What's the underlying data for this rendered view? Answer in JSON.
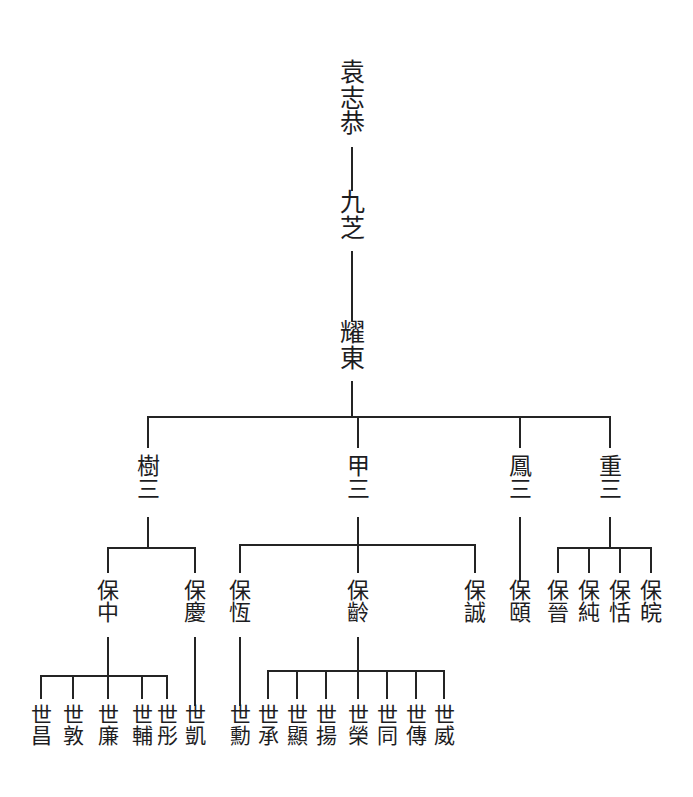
{
  "document": {
    "kind": "genealogy-chart",
    "orientation": "vertical-top-down",
    "script": "traditional-chinese",
    "background_color": "#ffffff",
    "ink_color": "#1d1d1f",
    "line_color": "#242424"
  },
  "generations": [
    {
      "index": 1,
      "label_y": 60
    },
    {
      "index": 2,
      "label_y": 190
    },
    {
      "index": 3,
      "label_y": 320
    },
    {
      "index": 4,
      "label_y": 455
    },
    {
      "index": 5,
      "label_y": 580
    },
    {
      "index": 6,
      "label_y": 705
    }
  ],
  "nodes": [
    {
      "id": "n1",
      "gen": 1,
      "chars": [
        "袁",
        "志",
        "恭"
      ],
      "x": 352,
      "y": 60,
      "parent": null
    },
    {
      "id": "n2",
      "gen": 2,
      "chars": [
        "九",
        "芝"
      ],
      "x": 352,
      "y": 190,
      "parent": "n1"
    },
    {
      "id": "n3",
      "gen": 3,
      "chars": [
        "耀",
        "東"
      ],
      "x": 352,
      "y": 320,
      "parent": "n2"
    },
    {
      "id": "g4a",
      "gen": 4,
      "chars": [
        "樹",
        "三"
      ],
      "x": 148,
      "y": 455,
      "parent": "n3"
    },
    {
      "id": "g4b",
      "gen": 4,
      "chars": [
        "甲",
        "三"
      ],
      "x": 358,
      "y": 455,
      "parent": "n3"
    },
    {
      "id": "g4c",
      "gen": 4,
      "chars": [
        "鳳",
        "三"
      ],
      "x": 520,
      "y": 455,
      "parent": "n3"
    },
    {
      "id": "g4d",
      "gen": 4,
      "chars": [
        "重",
        "三"
      ],
      "x": 610,
      "y": 455,
      "parent": "n3"
    },
    {
      "id": "g5a",
      "gen": 5,
      "chars": [
        "保",
        "中"
      ],
      "x": 108,
      "y": 580,
      "parent": "g4a"
    },
    {
      "id": "g5b",
      "gen": 5,
      "chars": [
        "保",
        "慶"
      ],
      "x": 195,
      "y": 580,
      "parent": "g4a"
    },
    {
      "id": "g5c",
      "gen": 5,
      "chars": [
        "保",
        "恆"
      ],
      "x": 240,
      "y": 580,
      "parent": "g4b"
    },
    {
      "id": "g5d",
      "gen": 5,
      "chars": [
        "保",
        "齡"
      ],
      "x": 358,
      "y": 580,
      "parent": "g4b"
    },
    {
      "id": "g5e",
      "gen": 5,
      "chars": [
        "保",
        "誠"
      ],
      "x": 475,
      "y": 580,
      "parent": "g4b"
    },
    {
      "id": "g5f",
      "gen": 5,
      "chars": [
        "保",
        "頤"
      ],
      "x": 520,
      "y": 580,
      "parent": "g4c"
    },
    {
      "id": "g5g",
      "gen": 5,
      "chars": [
        "保",
        "晉"
      ],
      "x": 558,
      "y": 580,
      "parent": "g4d"
    },
    {
      "id": "g5h",
      "gen": 5,
      "chars": [
        "保",
        "純"
      ],
      "x": 589,
      "y": 580,
      "parent": "g4d"
    },
    {
      "id": "g5i",
      "gen": 5,
      "chars": [
        "保",
        "恬"
      ],
      "x": 620,
      "y": 580,
      "parent": "g4d"
    },
    {
      "id": "g5j",
      "gen": 5,
      "chars": [
        "保",
        "皖"
      ],
      "x": 651,
      "y": 580,
      "parent": "g4d"
    },
    {
      "id": "g6a",
      "gen": 6,
      "chars": [
        "世",
        "昌"
      ],
      "x": 41,
      "y": 705,
      "parent": "g5a"
    },
    {
      "id": "g6b",
      "gen": 6,
      "chars": [
        "世",
        "敦"
      ],
      "x": 73,
      "y": 705,
      "parent": "g5a"
    },
    {
      "id": "g6c",
      "gen": 6,
      "chars": [
        "世",
        "廉"
      ],
      "x": 108,
      "y": 705,
      "parent": "g5a"
    },
    {
      "id": "g6d",
      "gen": 6,
      "chars": [
        "世",
        "輔"
      ],
      "x": 142,
      "y": 705,
      "parent": "g5a"
    },
    {
      "id": "g6e",
      "gen": 6,
      "chars": [
        "世",
        "彤"
      ],
      "x": 167,
      "y": 705,
      "parent": "g5a"
    },
    {
      "id": "g6f",
      "gen": 6,
      "chars": [
        "世",
        "凱"
      ],
      "x": 195,
      "y": 705,
      "parent": "g5b"
    },
    {
      "id": "g6g",
      "gen": 6,
      "chars": [
        "世",
        "勳"
      ],
      "x": 240,
      "y": 705,
      "parent": "g5c"
    },
    {
      "id": "g6h",
      "gen": 6,
      "chars": [
        "世",
        "承"
      ],
      "x": 268,
      "y": 705,
      "parent": "g5d"
    },
    {
      "id": "g6i",
      "gen": 6,
      "chars": [
        "世",
        "顯"
      ],
      "x": 297,
      "y": 705,
      "parent": "g5d"
    },
    {
      "id": "g6j",
      "gen": 6,
      "chars": [
        "世",
        "揚"
      ],
      "x": 326,
      "y": 705,
      "parent": "g5d"
    },
    {
      "id": "g6k",
      "gen": 6,
      "chars": [
        "世",
        "榮"
      ],
      "x": 358,
      "y": 705,
      "parent": "g5d"
    },
    {
      "id": "g6l",
      "gen": 6,
      "chars": [
        "世",
        "同"
      ],
      "x": 387,
      "y": 705,
      "parent": "g5d"
    },
    {
      "id": "g6m",
      "gen": 6,
      "chars": [
        "世",
        "傳"
      ],
      "x": 416,
      "y": 705,
      "parent": "g5d"
    },
    {
      "id": "g6n",
      "gen": 6,
      "chars": [
        "世",
        "威"
      ],
      "x": 444,
      "y": 705,
      "parent": "g5d"
    }
  ],
  "connectors": {
    "straight": [
      {
        "id": "c-n1-n2",
        "from": "n1",
        "to": "n2",
        "x": 352,
        "y1": 148,
        "y2": 190
      },
      {
        "id": "c-n2-n3",
        "from": "n2",
        "to": "n3",
        "x": 352,
        "y1": 252,
        "y2": 320
      },
      {
        "id": "c-g4c-g5f",
        "from": "g4c",
        "to": "g5f",
        "x": 520,
        "y1": 518,
        "y2": 580
      },
      {
        "id": "c-g5b-g6f",
        "from": "g5b",
        "to": "g6f",
        "x": 195,
        "y1": 638,
        "y2": 705
      },
      {
        "id": "c-g5c-g6g",
        "from": "g5c",
        "to": "g6g",
        "x": 240,
        "y1": 638,
        "y2": 705
      }
    ],
    "brackets": [
      {
        "id": "b-n3-gen4",
        "parent": "n3",
        "stem_x": 352,
        "stem_top": 382,
        "bar_y": 417,
        "drop_to": 447,
        "children_x": [
          148,
          358,
          520,
          610
        ]
      },
      {
        "id": "b-g4a-gen5",
        "parent": "g4a",
        "stem_x": 148,
        "stem_top": 518,
        "bar_y": 548,
        "drop_to": 572,
        "children_x": [
          108,
          195
        ]
      },
      {
        "id": "b-g4b-gen5",
        "parent": "g4b",
        "stem_x": 358,
        "stem_top": 518,
        "bar_y": 545,
        "drop_to": 572,
        "children_x": [
          240,
          358,
          475
        ]
      },
      {
        "id": "b-g4d-gen5",
        "parent": "g4d",
        "stem_x": 610,
        "stem_top": 518,
        "bar_y": 548,
        "drop_to": 572,
        "children_x": [
          558,
          589,
          620,
          651
        ]
      },
      {
        "id": "b-g5a-gen6",
        "parent": "g5a",
        "stem_x": 108,
        "stem_top": 638,
        "bar_y": 676,
        "drop_to": 698,
        "children_x": [
          41,
          73,
          108,
          142,
          167
        ]
      },
      {
        "id": "b-g5d-gen6",
        "parent": "g5d",
        "stem_x": 358,
        "stem_top": 638,
        "bar_y": 671,
        "drop_to": 698,
        "children_x": [
          268,
          297,
          326,
          358,
          387,
          416,
          444
        ]
      }
    ]
  }
}
